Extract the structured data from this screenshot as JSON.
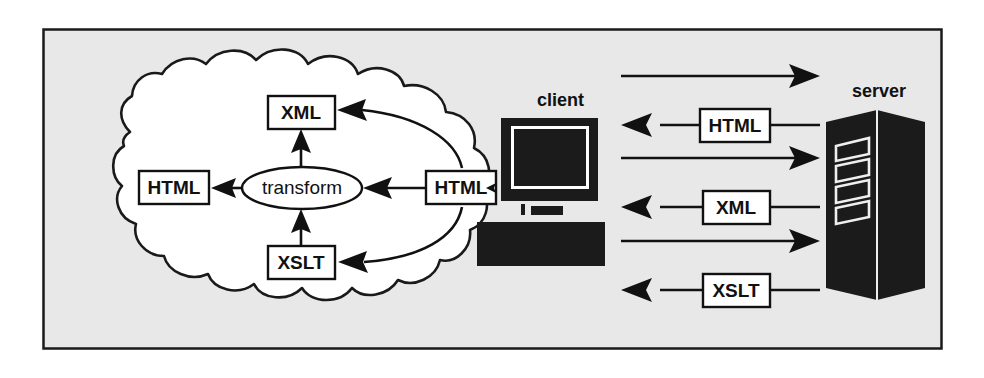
{
  "figure": {
    "background_color": "#e8e8e8",
    "frame_color": "#1a1a1a",
    "ink_color": "#111111"
  },
  "cloud": {
    "name": "client-processing-cloud",
    "fill": "#ffffff",
    "nodes": {
      "output_html": "HTML",
      "transform": "transform",
      "source_html": "HTML",
      "xml": "XML",
      "xslt": "XSLT"
    }
  },
  "client": {
    "label": "client",
    "parts": {
      "monitor": "monitor",
      "screen": "screen",
      "stand": "stand",
      "keyboard": "keyboard"
    }
  },
  "server": {
    "label": "server",
    "drive_bays": 4
  },
  "exchanges": [
    {
      "id": "request-1",
      "direction": "to-server",
      "label": "",
      "arrow": "right"
    },
    {
      "id": "response-html",
      "direction": "to-client",
      "label": "HTML",
      "arrow": "left"
    },
    {
      "id": "request-2",
      "direction": "to-server",
      "label": "",
      "arrow": "right"
    },
    {
      "id": "response-xml",
      "direction": "to-client",
      "label": "XML",
      "arrow": "left"
    },
    {
      "id": "request-3",
      "direction": "to-server",
      "label": "",
      "arrow": "right"
    },
    {
      "id": "response-xslt",
      "direction": "to-client",
      "label": "XSLT",
      "arrow": "left"
    }
  ]
}
